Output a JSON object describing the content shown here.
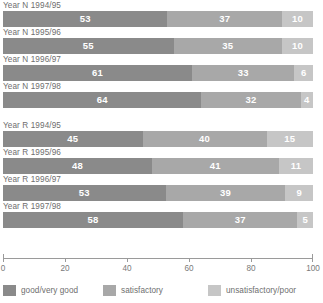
{
  "chart_data": {
    "type": "bar",
    "orientation": "horizontal",
    "stacked": true,
    "stacked_percent": true,
    "title": "",
    "xlabel": "",
    "ylabel": "",
    "xlim": [
      0,
      100
    ],
    "grid": false,
    "legend_position": "bottom",
    "categories": [
      "Year N 1994/95",
      "Year N 1995/96",
      "Year N 1996/97",
      "Year N 1997/98",
      "Year R 1994/95",
      "Year R 1995/96",
      "Year R 1996/97",
      "Year R 1997/98"
    ],
    "series": [
      {
        "name": "good/very good",
        "color": "#8a8a8a",
        "values": [
          53,
          55,
          61,
          64,
          45,
          48,
          53,
          58
        ]
      },
      {
        "name": "satisfactory",
        "color": "#a8a8a8",
        "values": [
          37,
          35,
          33,
          32,
          40,
          41,
          39,
          37
        ]
      },
      {
        "name": "unsatisfactory/poor",
        "color": "#c6c6c6",
        "values": [
          10,
          10,
          6,
          4,
          15,
          11,
          9,
          5
        ]
      }
    ],
    "xticks": [
      0,
      20,
      40,
      60,
      80,
      100
    ],
    "xtick_labels": [
      "0",
      "20",
      "40",
      "60",
      "80",
      "100"
    ],
    "group_break_after_index": 3
  },
  "legend": {
    "items": [
      {
        "label": "good/very good",
        "color": "#8a8a8a"
      },
      {
        "label": "satisfactory",
        "color": "#a8a8a8"
      },
      {
        "label": "unsatisfactory/poor",
        "color": "#c6c6c6"
      }
    ]
  },
  "colors": {
    "series_0": "#8a8a8a",
    "series_1": "#a8a8a8",
    "series_2": "#c6c6c6",
    "axis": "#9a9a9a",
    "text": "#6e6e6e",
    "bar_label": "#ffffff",
    "background": "#ffffff"
  }
}
